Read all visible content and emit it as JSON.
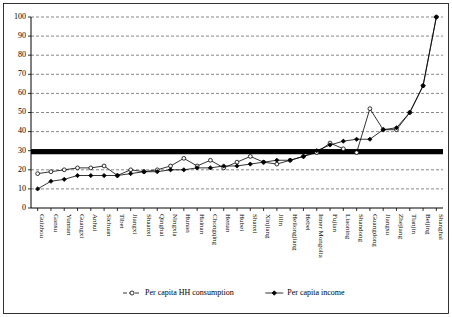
{
  "chart_data": {
    "type": "line",
    "title": "",
    "xlabel": "",
    "ylabel": "",
    "ylim": [
      0,
      100
    ],
    "yticks": [
      0,
      10,
      20,
      30,
      40,
      50,
      60,
      70,
      80,
      90,
      100
    ],
    "grid": true,
    "legend_position": "bottom",
    "categories": [
      "Guizhou",
      "Gansu",
      "Yunnan",
      "Guangxi",
      "Anhui",
      "Sichuan",
      "Tibet",
      "Jiangxi",
      "Shaanxi",
      "Qinghai",
      "Ningxia",
      "Hunan",
      "Hainan",
      "Chongqing",
      "Henan",
      "Hubei",
      "Shanxi",
      "Xinjiang",
      "Jilin",
      "Heilongjiang",
      "Hebei",
      "Inner Mongolia",
      "Fujian",
      "Liaoning",
      "Shandong",
      "Guangdong",
      "Jiangsu",
      "Zhejiang",
      "Tianjin",
      "Beijing",
      "Shanghai"
    ],
    "series": [
      {
        "name": "Per capita HH consumption",
        "marker": "open-circle",
        "values": [
          18,
          19,
          20,
          21,
          21,
          22,
          17,
          20,
          19,
          20,
          22,
          26,
          22,
          25,
          21,
          24,
          27,
          24,
          23,
          25,
          27,
          29,
          34,
          31,
          29,
          52,
          41,
          41,
          50,
          64,
          100
        ]
      },
      {
        "name": "Per capita income",
        "marker": "solid-diamond",
        "values": [
          10,
          14,
          15,
          17,
          17,
          17,
          17,
          18,
          19,
          19,
          20,
          20,
          21,
          21,
          22,
          22,
          23,
          24,
          25,
          25,
          27,
          30,
          33,
          35,
          36,
          36,
          41,
          42,
          50,
          64,
          100
        ]
      }
    ],
    "reference_bar": {
      "name": "national-average-bar",
      "value": 29.5
    }
  },
  "legend": {
    "items": [
      {
        "label": "Per capita HH consumption",
        "marker": "open-circle"
      },
      {
        "label": "Per capita income",
        "marker": "solid-diamond"
      }
    ]
  }
}
